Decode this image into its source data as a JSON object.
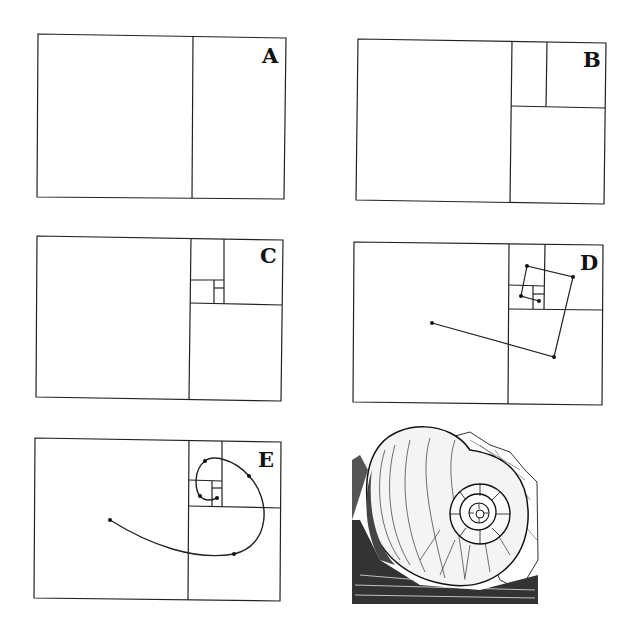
{
  "figure": {
    "stroke_color": "#222222",
    "panels": [
      {
        "label": "A",
        "stage": "golden rectangle divided into square and smaller rectangle"
      },
      {
        "label": "B",
        "stage": "smaller rectangle subdivided again"
      },
      {
        "label": "C",
        "stage": "further nested subdivisions"
      },
      {
        "label": "D",
        "stage": "connecting polyline through square corners"
      },
      {
        "label": "E",
        "stage": "smooth logarithmic spiral through points"
      }
    ],
    "illustration": {
      "subject": "nautilus shell engraving"
    }
  }
}
